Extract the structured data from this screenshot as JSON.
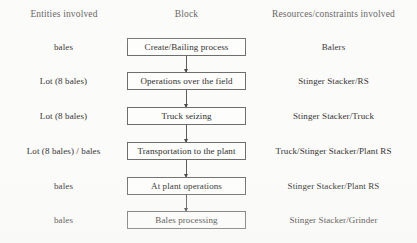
{
  "diagram": {
    "columns": {
      "left_header": "Entities involved",
      "center_header": "Block",
      "right_header": "Resources/constraints involved"
    },
    "rows": [
      {
        "entity": "bales",
        "block": "Create/Bailing process",
        "resource": "Balers"
      },
      {
        "entity": "Lot (8 bales)",
        "block": "Operations over the field",
        "resource": "Stinger Stacker/RS"
      },
      {
        "entity": "Lot (8 bales)",
        "block": "Truck seizing",
        "resource": "Stinger Stacker/Truck"
      },
      {
        "entity": "Lot (8 bales) / bales",
        "block": "Transportation to the plant",
        "resource": "Truck/Stinger Stacker/Plant RS"
      },
      {
        "entity": "bales",
        "block": "At plant operations",
        "resource": "Stinger Stacker/Plant RS"
      },
      {
        "entity": "bales",
        "block": "Bales processing",
        "resource": "Stinger Stacker/Grinder"
      }
    ],
    "connectors": [
      {
        "from": "Create/Bailing process",
        "to": "Operations over the field",
        "style": "down-arrow"
      },
      {
        "from": "Operations over the field",
        "to": "Truck seizing",
        "style": "down-arrow"
      },
      {
        "from": "Truck seizing",
        "to": "Transportation to the plant",
        "style": "down-arrow"
      },
      {
        "from": "Transportation to the plant",
        "to": "At plant operations",
        "style": "down-arrow"
      },
      {
        "from": "At plant operations",
        "to": "Bales processing",
        "style": "down-arrow"
      }
    ],
    "colors": {
      "background": "#fbfbfa",
      "box_border": "#6e6e6c",
      "box_fill": "#fdfdfc",
      "text": "#2e2e2c",
      "arrow": "#5d5d5b"
    }
  }
}
